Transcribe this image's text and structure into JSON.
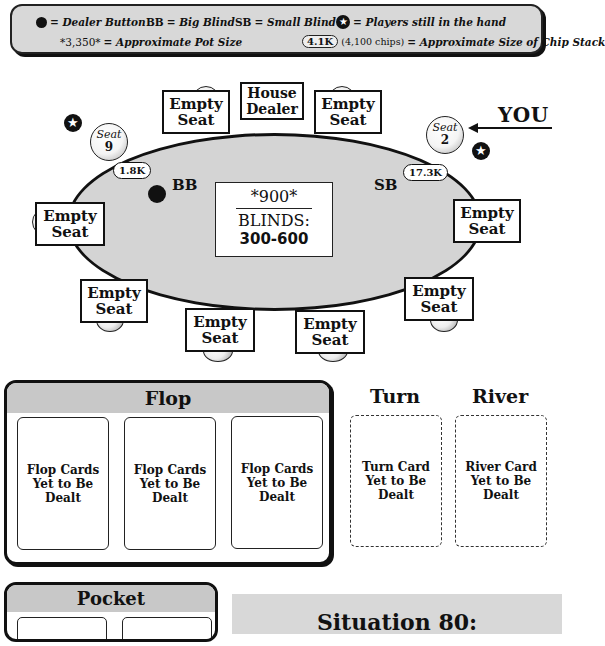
{
  "legend": {
    "dealer_button": "= Dealer Button",
    "bb_abbr": "BB",
    "bb_desc": "= Big Blind",
    "sb_abbr": "SB",
    "sb_desc": "= Small Blind",
    "star_desc": "= Players still in the hand",
    "pot_example": "*3,350*",
    "pot_desc": "= Approximate Pot Size",
    "chip_example": "4.1K",
    "chip_note": "(4,100 chips)",
    "chip_desc": "= Approximate Size of Chip Stack",
    "star_glyph": "★"
  },
  "table": {
    "house_dealer": [
      "House",
      "Dealer"
    ],
    "empty_seat": [
      "Empty",
      "Seat"
    ],
    "seats": [
      {
        "seat_word": "Seat",
        "number": "9",
        "stack": "1.8K",
        "blind": "BB",
        "in_hand": true,
        "dealer": true
      },
      {
        "seat_word": "Seat",
        "number": "2",
        "stack": "17.3K",
        "blind": "SB",
        "in_hand": true,
        "dealer": false
      }
    ],
    "you_label": "YOU",
    "pot": "*900*",
    "blinds_label": "BLINDS:",
    "blinds_value": "300-600",
    "felt_color": "#d4d4d4"
  },
  "board": {
    "flop_title": "Flop",
    "flop_cards": [
      "Flop Cards\nYet to Be\nDealt",
      "Flop Cards\nYet to Be\nDealt",
      "Flop Cards\nYet to Be\nDealt"
    ],
    "flop_lines": [
      "Flop Cards",
      "Yet to Be",
      "Dealt"
    ],
    "turn_title": "Turn",
    "turn_lines": [
      "Turn Card",
      "Yet to Be",
      "Dealt"
    ],
    "river_title": "River",
    "river_lines": [
      "River Card",
      "Yet to Be",
      "Dealt"
    ]
  },
  "pocket": {
    "title": "Pocket"
  },
  "situation": {
    "title": "Situation 80:"
  }
}
